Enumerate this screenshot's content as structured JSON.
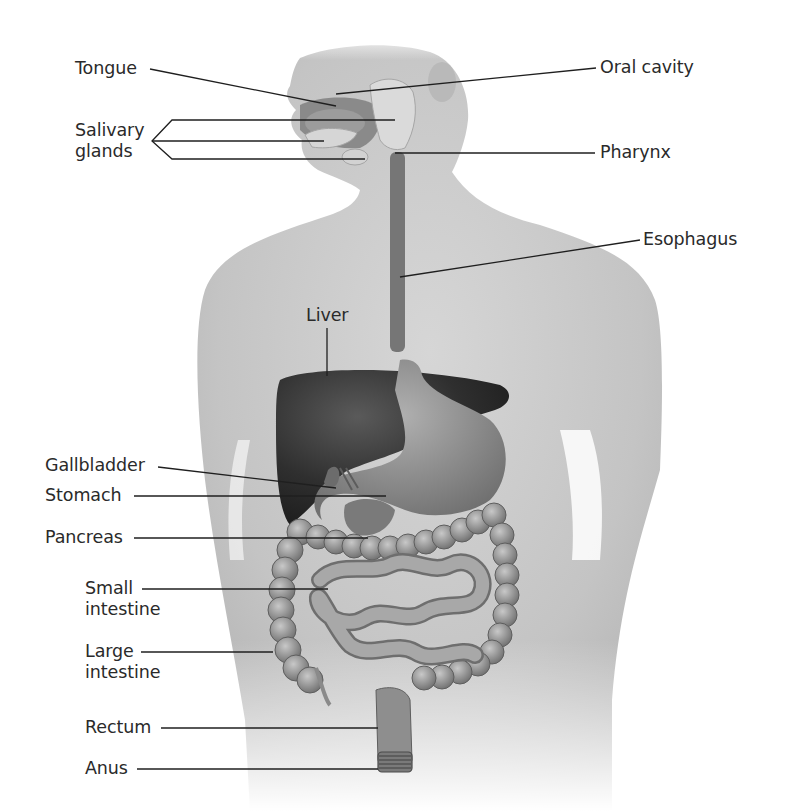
{
  "figure": {
    "labels": {
      "tongue": "Tongue",
      "oral_cavity": "Oral cavity",
      "salivary_glands_line1": "Salivary",
      "salivary_glands_line2": "glands",
      "pharynx": "Pharynx",
      "esophagus": "Esophagus",
      "liver": "Liver",
      "gallbladder": "Gallbladder",
      "stomach": "Stomach",
      "pancreas": "Pancreas",
      "small_intestine_line1": "Small",
      "small_intestine_line2": "intestine",
      "large_intestine_line1": "Large",
      "large_intestine_line2": "intestine",
      "rectum": "Rectum",
      "anus": "Anus"
    },
    "colors": {
      "background": "#ffffff",
      "skin": "#c9c9c9",
      "skin_shadow": "#a9a9a9",
      "liver": "#3a3a3a",
      "stomach": "#8f8f8f",
      "intestine": "#9a9a9a",
      "esophagus": "#6f6f6f",
      "gland": "#d8d8d8",
      "leader_line": "#1f1f1f",
      "text": "#2a2a2a"
    }
  }
}
